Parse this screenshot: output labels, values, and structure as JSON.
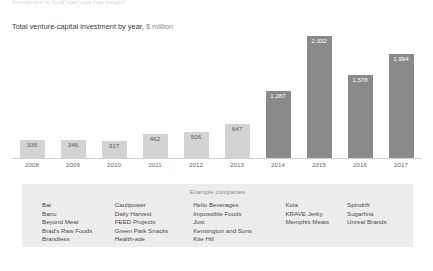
{
  "page": {
    "cutoff_text": "Investment in food start-ups has surged",
    "title_main": "Total venture-capital investment by year,",
    "title_unit": "$ million"
  },
  "chart_data": {
    "type": "bar",
    "title": "Total venture-capital investment by year, $ million",
    "xlabel": "",
    "ylabel": "$ million",
    "categories": [
      "2008",
      "2009",
      "2010",
      "2011",
      "2012",
      "2013",
      "2014",
      "2015",
      "2016",
      "2017"
    ],
    "values": [
      336,
      346,
      317,
      462,
      506,
      647,
      1287,
      2332,
      1578,
      1994
    ],
    "value_labels": [
      "336",
      "346",
      "317",
      "462",
      "506",
      "647",
      "1,287",
      "2,332",
      "1,578",
      "1,994"
    ],
    "bar_styles": [
      "light",
      "light",
      "light",
      "light",
      "light",
      "light",
      "dark",
      "dark",
      "dark",
      "dark"
    ],
    "ylim": [
      0,
      2332
    ],
    "grid": false,
    "legend": "none",
    "colors": {
      "light_bar": "#d3d3d3",
      "dark_bar": "#8a8a8a",
      "light_bar_label": "#5d5d5d",
      "dark_bar_label": "#ffffff",
      "axis_line": "#d0d0d0",
      "panel_background": "#ededed"
    }
  },
  "legend_panel": {
    "heading": "Example companies",
    "columns": [
      [
        "Bai",
        "Banu",
        "Beyond Meat",
        "Brad's Raw Foods",
        "Brandless"
      ],
      [
        "Caulipower",
        "Daily Harvest",
        "FEED Projects",
        "Green Park Snacks",
        "Health-ade"
      ],
      [
        "Hello Beverages",
        "Impossible Foods",
        "Just",
        "Kensington and Sons",
        "Kite Hill"
      ],
      [
        "Koia",
        "KRAVE Jerky",
        "Memphis Meats"
      ],
      [
        "Spindrift",
        "Sugarfina",
        "Unreal Brands"
      ]
    ]
  }
}
